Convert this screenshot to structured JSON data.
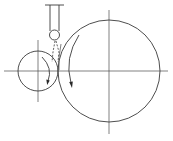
{
  "diagram": {
    "description": "Grinding/rolling mechanism: small roller contacting large wheel, with vertical nozzle/tool and ball tip feeding at the contact point",
    "colors": {
      "line": "#3a3a3a",
      "background": "#ffffff"
    },
    "components": {
      "large_wheel": {
        "cx": 109,
        "cy": 71,
        "r": 51,
        "rotation": "counter-clockwise arrow on inner left side"
      },
      "small_roller": {
        "cx": 38,
        "cy": 71,
        "r": 20,
        "rotation": "arrow on inner right side pointing down"
      },
      "tool": {
        "rail_left_x": 50,
        "rail_right_x": 59,
        "top_y": 5,
        "bottom_y": 30,
        "cap_x1": 45,
        "cap_x2": 64
      },
      "ball_tip": {
        "cx": 54.5,
        "cy": 35,
        "r": 5
      },
      "centerlines": {
        "horizontal": {
          "y": 71,
          "x1": 4,
          "x2": 168
        },
        "large_vertical": {
          "x": 109,
          "y1": 10,
          "y2": 134
        },
        "small_vertical": {
          "x": 38,
          "y1": 40,
          "y2": 102
        }
      }
    },
    "labels": []
  }
}
